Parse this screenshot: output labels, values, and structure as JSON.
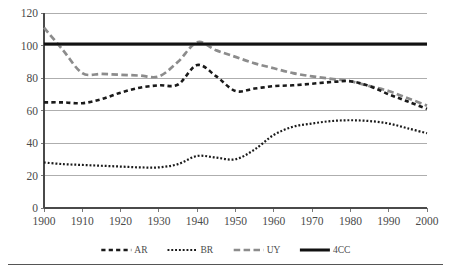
{
  "chart_data": {
    "type": "line",
    "title": "",
    "xlabel": "",
    "ylabel": "",
    "xlim": [
      1900,
      2000
    ],
    "ylim": [
      0,
      120
    ],
    "ytick_step": 20,
    "xtick_step": 10,
    "grid": true,
    "legend_position": "bottom",
    "xticks": [
      "1900",
      "1910",
      "1920",
      "1930",
      "1940",
      "1950",
      "1960",
      "1970",
      "1980",
      "1990",
      "2000"
    ],
    "yticks": [
      "0",
      "20",
      "40",
      "60",
      "80",
      "100",
      "120"
    ],
    "x": [
      1900,
      1905,
      1910,
      1915,
      1920,
      1925,
      1930,
      1935,
      1940,
      1945,
      1950,
      1955,
      1960,
      1965,
      1970,
      1975,
      1980,
      1985,
      1990,
      1995,
      2000
    ],
    "series": [
      {
        "name": "AR",
        "color": "#1a1a1a",
        "style": "dashed",
        "values": [
          65,
          65,
          64.5,
          67,
          71,
          74,
          75.5,
          76,
          88,
          81,
          72,
          73.5,
          75,
          75.5,
          76.5,
          77.5,
          78,
          75,
          70,
          65.5,
          61
        ]
      },
      {
        "name": "BR",
        "color": "#1a1a1a",
        "style": "dotted",
        "values": [
          28,
          27,
          26.5,
          26,
          25.5,
          25,
          25,
          27,
          32,
          31,
          30,
          36,
          45,
          50,
          52,
          53.5,
          54,
          53.5,
          52,
          49,
          46
        ]
      },
      {
        "name": "UY",
        "color": "#8c8c8c",
        "style": "long-dashed",
        "values": [
          111,
          97,
          83,
          82.5,
          82,
          81.5,
          81,
          90,
          102,
          97,
          93,
          89,
          86,
          83,
          81,
          79.5,
          78,
          75,
          72,
          67.5,
          63
        ]
      },
      {
        "name": "4CC",
        "color": "#111111",
        "style": "solid-thick",
        "values": [
          101,
          101,
          101,
          101,
          101,
          101,
          101,
          101,
          101,
          101,
          101,
          101,
          101,
          101,
          101,
          101,
          101,
          101,
          101,
          101,
          101
        ]
      }
    ],
    "legend": [
      {
        "label": "AR",
        "marker": "dashed-line-marker"
      },
      {
        "label": "BR",
        "marker": "dotted-line-marker"
      },
      {
        "label": "UY",
        "marker": "gray-dashed-line-marker"
      },
      {
        "label": "4CC",
        "marker": "solid-line-marker"
      }
    ]
  }
}
